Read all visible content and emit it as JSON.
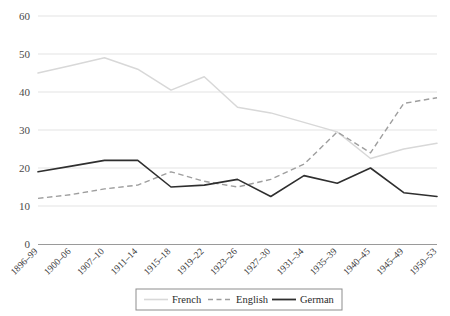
{
  "chart_data": {
    "type": "line",
    "title": "",
    "subtitle": "",
    "xlabel": "",
    "ylabel": "",
    "ylim": [
      0,
      60
    ],
    "yticks": [
      0,
      10,
      20,
      30,
      40,
      50,
      60
    ],
    "grid": true,
    "legend_position": "bottom",
    "categories": [
      "1896–99",
      "1900–06",
      "1907–10",
      "1911–14",
      "1915–18",
      "1919–22",
      "1923–26",
      "1927–30",
      "1931–34",
      "1935–39",
      "1940–45",
      "1945–49",
      "1950–53"
    ],
    "series": [
      {
        "name": "French",
        "style": "solid-light",
        "color": "#d8d8d8",
        "values": [
          45,
          47,
          49,
          46,
          40.5,
          44,
          36,
          34.5,
          32,
          29.5,
          22.5,
          25,
          26.5
        ]
      },
      {
        "name": "English",
        "style": "dashed",
        "color": "#9e9e9e",
        "values": [
          12,
          13,
          14.5,
          15.5,
          19,
          16.5,
          15,
          17,
          21,
          29.5,
          24,
          37,
          38.5
        ]
      },
      {
        "name": "German",
        "style": "solid-dark",
        "color": "#2f2f2f",
        "values": [
          19,
          20.5,
          22,
          22,
          15,
          15.5,
          17,
          12.5,
          18,
          16,
          20,
          13.5,
          12.5
        ]
      }
    ]
  },
  "legend": {
    "items": [
      {
        "label": "French"
      },
      {
        "label": "English"
      },
      {
        "label": "German"
      }
    ]
  }
}
